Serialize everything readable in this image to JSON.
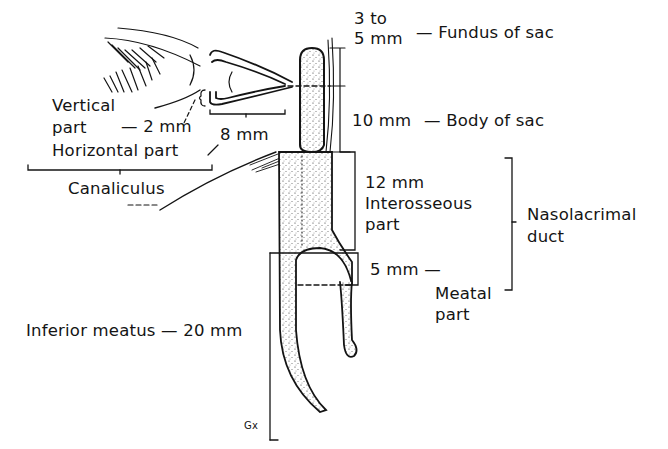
{
  "diagram": {
    "title_visible": false,
    "labels": {
      "fundus_size_line1": "3 to",
      "fundus_size_line2": "5 mm",
      "fundus_name": "— Fundus of sac",
      "body_size": "10 mm",
      "body_name": "— Body of sac",
      "vertical_line1": "Vertical",
      "vertical_line2": "part",
      "vertical_size": "— 2 mm",
      "horizontal_size": "8 mm",
      "horizontal_name": "Horizontal part",
      "canaliculus": "Canaliculus",
      "interosseous_size": "12 mm",
      "interosseous_line1": "Interosseous",
      "interosseous_line2": "part",
      "nasolacrimal_line1": "Nasolacrimal",
      "nasolacrimal_line2": "duct",
      "meatal_size": "5 mm —",
      "meatal_line1": "Meatal",
      "meatal_line2": "part",
      "inferior_meatus": "Inferior meatus — 20 mm",
      "artist_mark": "Gx"
    },
    "colors": {
      "ink": "#141414",
      "background": "#ffffff"
    }
  }
}
